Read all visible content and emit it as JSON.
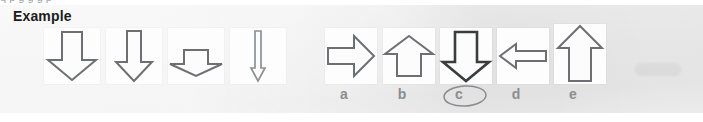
{
  "page": {
    "width": 703,
    "height": 122,
    "background_color": "#ffffff",
    "clipped_text_above_panel": "q  p   g   g   g   p"
  },
  "panel": {
    "background_color": "#ededed",
    "heading": "Example"
  },
  "stimulus": {
    "caption": "sequence of four downward arrows",
    "items": [
      {
        "index": 0,
        "name": "arrow-wide-head-short-shaft",
        "direction": "down",
        "description": "broad arrowhead with short narrow shaft",
        "stroke_color": "#6d6f73",
        "tile": {
          "x": 44,
          "y": 28,
          "w": 56,
          "h": 56
        },
        "path": "M 18 4 L 38 4 L 38 32 L 52 32 L 28 52 L 4 32 L 18 32 Z"
      },
      {
        "index": 1,
        "name": "arrow-narrow-tall-shaft",
        "direction": "down",
        "description": "tall narrow shaft with medium arrowhead",
        "stroke_color": "#6d6f73",
        "tile": {
          "x": 106,
          "y": 28,
          "w": 56,
          "h": 56
        },
        "path": "M 21 3 L 35 3 L 35 34 L 46 34 L 28 53 L 10 34 L 21 34 Z"
      },
      {
        "index": 2,
        "name": "arrow-flat-wide-short",
        "direction": "down",
        "description": "short squat shaft with very wide flat arrowhead",
        "stroke_color": "#6d6f73",
        "tile": {
          "x": 168,
          "y": 28,
          "w": 56,
          "h": 56
        },
        "path": "M 16 22 L 40 22 L 40 36 L 54 36 L 28 48 L 2 36 L 16 36 Z"
      },
      {
        "index": 3,
        "name": "arrow-needle-thin",
        "direction": "down",
        "description": "very thin needle-like shaft with slender arrowhead",
        "stroke_color": "#8d9094",
        "tile": {
          "x": 230,
          "y": 28,
          "w": 56,
          "h": 56
        },
        "path": "M 25 3 L 31 3 L 31 40 L 35 40 L 28 53 L 21 40 L 25 40 Z"
      }
    ]
  },
  "answers": {
    "correct_option": "c",
    "marked_option": "c",
    "options": [
      {
        "label": "a",
        "name": "arrow-right",
        "direction": "right",
        "selected": false,
        "stroke_color": "#6d6f73",
        "tile": {
          "x": 325,
          "y": 28,
          "w": 52,
          "h": 56
        },
        "label_x": 331,
        "path": "M 3 20 L 29 20 L 29 8 L 49 28 L 29 48 L 29 36 L 3 36 Z"
      },
      {
        "label": "b",
        "name": "arrow-up-short-wide-head",
        "direction": "up",
        "selected": false,
        "stroke_color": "#6d6f73",
        "tile": {
          "x": 383,
          "y": 28,
          "w": 52,
          "h": 56
        },
        "label_x": 389,
        "path": "M 26 8 L 50 26 L 38 26 L 38 48 L 14 48 L 14 26 L 2 26 Z"
      },
      {
        "label": "c",
        "name": "arrow-down",
        "direction": "down",
        "selected": true,
        "stroke_color": "#3a3c3f",
        "tile": {
          "x": 440,
          "y": 28,
          "w": 52,
          "h": 56
        },
        "label_x": 446,
        "path": "M 15 4 L 37 4 L 37 34 L 49 34 L 26 53 L 3 34 L 15 34 Z"
      },
      {
        "label": "d",
        "name": "arrow-left-thin",
        "direction": "left",
        "selected": false,
        "stroke_color": "#6d6f73",
        "tile": {
          "x": 497,
          "y": 28,
          "w": 52,
          "h": 56
        },
        "label_x": 503,
        "path": "M 3 28 L 19 16 L 19 23 L 49 23 L 49 33 L 19 33 L 19 40 Z"
      },
      {
        "label": "e",
        "name": "arrow-up-tall",
        "direction": "up",
        "selected": false,
        "stroke_color": "#6d6f73",
        "tile": {
          "x": 554,
          "y": 24,
          "w": 52,
          "h": 60
        },
        "label_x": 560,
        "path": "M 26 2 L 48 24 L 37 24 L 37 57 L 15 57 L 15 24 L 4 24 Z"
      }
    ]
  },
  "annotation": {
    "type": "hand-drawn-ellipse",
    "over_option": "c",
    "color": "#8a8c8f",
    "geometry": {
      "x": 441,
      "y": 84,
      "w": 48,
      "h": 24,
      "cx": 24,
      "cy": 12,
      "rx": 21,
      "ry": 10
    }
  }
}
